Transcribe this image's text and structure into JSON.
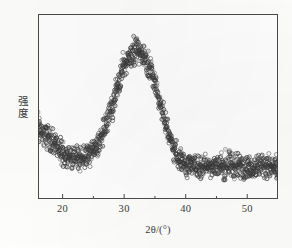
{
  "chart_data": {
    "type": "scatter",
    "title": "",
    "subtitle": "",
    "xlabel": "2θ/(°)",
    "ylabel": "强度",
    "ylabel_chars": [
      "强",
      "度"
    ],
    "xlim": [
      16,
      55
    ],
    "ylim": [
      0,
      100
    ],
    "grid": false,
    "legend": null,
    "legend_position": "none",
    "x_major_ticks": [
      20,
      30,
      40,
      50
    ],
    "x_major_tick_labels": [
      "20",
      "30",
      "40",
      "50"
    ],
    "x_minor_ticks": [
      25,
      35,
      45
    ],
    "y_ticks": [],
    "y_tick_labels": [],
    "tick_direction": "in",
    "marker": "open-circle",
    "marker_color": "#4c4c4c",
    "marker_size": 2.0,
    "noise_amplitude": 6.5,
    "annotations": [],
    "series": [
      {
        "name": "XRD intensity",
        "x": [
          16,
          17,
          18,
          19,
          20,
          21,
          22,
          23,
          24,
          25,
          26,
          27,
          28,
          29,
          30,
          31,
          32,
          33,
          34,
          35,
          36,
          37,
          38,
          39,
          40,
          41,
          42,
          43,
          44,
          45,
          46,
          47,
          48,
          49,
          50,
          51,
          52,
          53,
          54,
          55
        ],
        "y": [
          40,
          36,
          32,
          28,
          25,
          23,
          22,
          22,
          23,
          26,
          31,
          39,
          50,
          62,
          72,
          78,
          80,
          79,
          73,
          63,
          50,
          38,
          28,
          22,
          19,
          18,
          18,
          18,
          18,
          18,
          18,
          18,
          18,
          18,
          18,
          18,
          18,
          18,
          17,
          16
        ]
      }
    ],
    "peak": {
      "position_2theta": 32,
      "description": "broad amorphous hump"
    }
  },
  "axes": {
    "frame_color": "#4a4a4a",
    "background": "#fefefe"
  }
}
